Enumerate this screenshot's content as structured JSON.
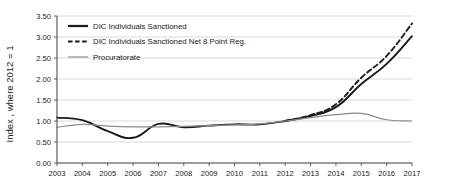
{
  "chart_data": {
    "type": "line",
    "title": "",
    "xlabel": "",
    "ylabel": "Index , where 2012 = 1",
    "x": [
      2003,
      2004,
      2005,
      2006,
      2007,
      2008,
      2009,
      2010,
      2011,
      2012,
      2013,
      2014,
      2015,
      2016,
      2017
    ],
    "categories": [
      "2003",
      "2004",
      "2005",
      "2006",
      "2007",
      "2008",
      "2009",
      "2010",
      "2011",
      "2012",
      "2013",
      "2014",
      "2015",
      "2016",
      "2017"
    ],
    "xlim": [
      2003,
      2017
    ],
    "ylim": [
      0.0,
      3.5
    ],
    "yticks": [
      0.0,
      0.5,
      1.0,
      1.5,
      2.0,
      2.5,
      3.0,
      3.5
    ],
    "ytick_labels": [
      "0.00",
      "0.50",
      "1.00",
      "1.50",
      "2.00",
      "2.50",
      "3.00",
      "3.50"
    ],
    "grid": true,
    "legend_position": "top-left",
    "series": [
      {
        "name": "DIC Individuals Sanctioned",
        "style": "solid",
        "color": "#1a1a1a",
        "values": [
          1.08,
          1.02,
          0.76,
          0.6,
          0.93,
          0.85,
          0.89,
          0.92,
          0.92,
          1.0,
          1.12,
          1.33,
          1.88,
          2.36,
          3.02
        ]
      },
      {
        "name": "DIC Individuals Sanctioned Net 8 Point Reg.",
        "style": "dashed",
        "color": "#1a1a1a",
        "values": [
          null,
          null,
          null,
          null,
          null,
          null,
          null,
          null,
          null,
          1.0,
          1.14,
          1.4,
          2.03,
          2.55,
          3.32
        ]
      },
      {
        "name": "Procuratorate",
        "style": "solid",
        "color": "#8c8c8c",
        "values": [
          0.85,
          0.92,
          0.88,
          0.86,
          0.86,
          0.87,
          0.89,
          0.91,
          0.93,
          1.0,
          1.08,
          1.15,
          1.18,
          1.03,
          1.0
        ]
      }
    ]
  },
  "legend": {
    "items": [
      {
        "label": "DIC Individuals Sanctioned"
      },
      {
        "label": "DIC Individuals Sanctioned Net 8 Point Reg."
      },
      {
        "label": "Procuratorate"
      }
    ]
  },
  "colors": {
    "primary": "#1a1a1a",
    "secondary": "#8c8c8c",
    "grid": "#c9c9c9",
    "axis": "#4d4d4d",
    "background": "#ffffff"
  }
}
